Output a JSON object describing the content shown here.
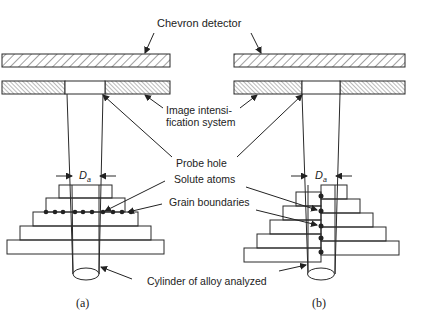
{
  "labels": {
    "chevron_detector": "Chevron detector",
    "image_intensification_line1": "Image intensi-",
    "image_intensification_line2": "fication system",
    "probe_hole": "Probe hole",
    "solute_atoms": "Solute atoms",
    "grain_boundaries": "Grain boundaries",
    "cylinder": "Cylinder of alloy analyzed",
    "da_symbol": "D",
    "da_subscript": "a"
  },
  "captions": {
    "left": "(a)",
    "right": "(b)"
  },
  "colors": {
    "line": "#2a2a2a",
    "hatch": "#555555",
    "background": "#ffffff"
  }
}
